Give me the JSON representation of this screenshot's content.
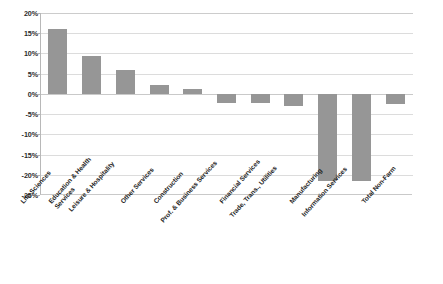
{
  "chart_data": {
    "type": "bar",
    "title": "",
    "subtitle": "",
    "xlabel": "",
    "ylabel": "",
    "ylim": [
      -25,
      20
    ],
    "ytick_step": 5,
    "grid": true,
    "legend": "none",
    "bar_color": "#969696",
    "gridline_color": "#dcdcdc",
    "axis_color": "#b8b8b8",
    "yticks": [
      "20%",
      "15%",
      "10%",
      "5%",
      "0%",
      "-5%",
      "-10%",
      "-15%",
      "-20%",
      "-25%"
    ],
    "ytick_values": [
      20,
      15,
      10,
      5,
      0,
      -5,
      -10,
      -15,
      -20,
      -25
    ],
    "categories": [
      "Life Sciences",
      "Education & Health Services",
      "Leisure & Hospitality",
      "Other Services",
      "Construction",
      "Prof. & Business Services",
      "Financial Services",
      "Trade, Trans., Utilities",
      "Manufacturing",
      "Information Services",
      "Total Non-Farm"
    ],
    "values": [
      16.0,
      9.3,
      6.0,
      2.2,
      1.3,
      -2.3,
      -2.3,
      -2.9,
      -21.5,
      -21.5,
      -2.5
    ],
    "series": [
      {
        "name": "Employment change",
        "values": [
          16.0,
          9.3,
          6.0,
          2.2,
          1.3,
          -2.3,
          -2.3,
          -2.9,
          -21.5,
          -21.5,
          -2.5
        ]
      }
    ]
  },
  "labels": {
    "c0": "Life Sciences",
    "c1a": "Education & Health",
    "c1b": "Services",
    "c2": "Leisure & Hospitality",
    "c3": "Other Services",
    "c4": "Construction",
    "c5": "Prof. & Business Services",
    "c6": "Financial Services",
    "c7": "Trade, Trans., Utilities",
    "c8": "Manufacturing",
    "c9": "Information Services",
    "c10": "Total Non-Farm"
  },
  "yticks": {
    "t0": "20%",
    "t1": "15%",
    "t2": "10%",
    "t3": "5%",
    "t4": "0%",
    "t5": "-5%",
    "t6": "-10%",
    "t7": "-15%",
    "t8": "-20%",
    "t9": "-25%"
  }
}
